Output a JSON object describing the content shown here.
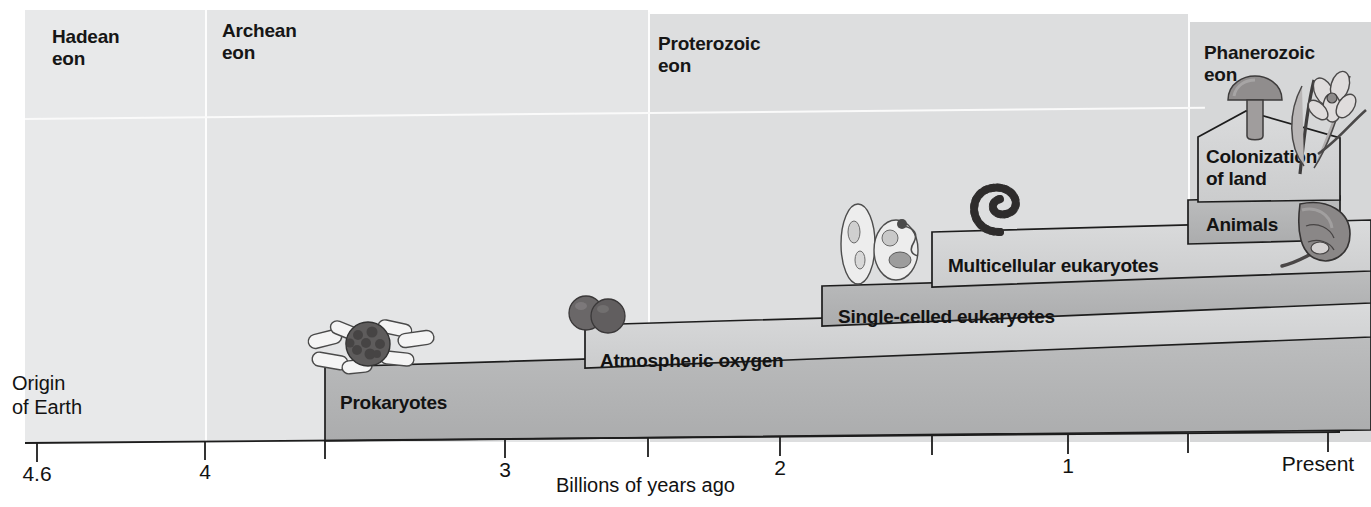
{
  "figure": {
    "axis_title": "Billions of years ago",
    "origin_label": "Origin\nof Earth"
  },
  "eons": [
    {
      "name": "Hadean\neon",
      "label_x": 52,
      "label_y": 26,
      "x0": 25,
      "x1": 205,
      "shade": "#e8e9ea"
    },
    {
      "name": "Archean\neon",
      "label_x": 222,
      "label_y": 20,
      "x0": 205,
      "x1": 648,
      "shade": "#e4e5e6"
    },
    {
      "name": "Proterozoic\neon",
      "label_x": 658,
      "label_y": 33,
      "x0": 648,
      "x1": 1188,
      "shade": "#dddedf"
    },
    {
      "name": "Phanerozoic\neon",
      "label_x": 1204,
      "label_y": 42,
      "x0": 1188,
      "x1": 1371,
      "shade": "#d6d7d8"
    }
  ],
  "steps": [
    {
      "name": "Prokaryotes",
      "label_x": 340,
      "label_y": 392,
      "start_x": 325,
      "tone": "dark"
    },
    {
      "name": "Atmospheric oxygen",
      "label_x": 600,
      "label_y": 350,
      "start_x": 585,
      "tone": "light"
    },
    {
      "name": "Single-celled eukaryotes",
      "label_x": 838,
      "label_y": 308,
      "start_x": 822,
      "tone": "dark"
    },
    {
      "name": "Multicellular eukaryotes",
      "label_x": 948,
      "label_y": 257,
      "start_x": 932,
      "tone": "light"
    },
    {
      "name": "Animals",
      "label_x": 1206,
      "label_y": 216,
      "start_x": 1188,
      "tone": "dark"
    },
    {
      "name": "Colonization\nof land",
      "label_x": 1206,
      "label_y": 147,
      "start_x": 1198,
      "tone": "light"
    }
  ],
  "axis": {
    "ticks": [
      {
        "label": "4.6",
        "x": 37,
        "labeled": true
      },
      {
        "label": "4",
        "x": 205,
        "labeled": true
      },
      {
        "label": "",
        "x": 325,
        "labeled": false
      },
      {
        "label": "3",
        "x": 505,
        "labeled": true
      },
      {
        "label": "",
        "x": 648,
        "labeled": false
      },
      {
        "label": "2",
        "x": 780,
        "labeled": true
      },
      {
        "label": "",
        "x": 932,
        "labeled": false
      },
      {
        "label": "1",
        "x": 1068,
        "labeled": true
      },
      {
        "label": "",
        "x": 1188,
        "labeled": false
      },
      {
        "label": "Present",
        "x": 1328,
        "labeled": true
      }
    ],
    "range_billions": [
      4.6,
      0
    ]
  },
  "organisms": [
    {
      "name": "prokaryote-cluster",
      "x": 318,
      "y": 322
    },
    {
      "name": "oxygen-molecule",
      "x": 566,
      "y": 288
    },
    {
      "name": "single-celled-protists",
      "x": 834,
      "y": 200
    },
    {
      "name": "multicellular-algae",
      "x": 966,
      "y": 170
    },
    {
      "name": "mushroom",
      "x": 1228,
      "y": 76
    },
    {
      "name": "flowering-plant",
      "x": 1284,
      "y": 62
    },
    {
      "name": "horseshoe-crab",
      "x": 1284,
      "y": 198
    }
  ],
  "colors": {
    "step_dark": "#b3b4b5",
    "step_light": "#d2d3d4",
    "outline": "#1d1d1d",
    "text": "#131313"
  }
}
